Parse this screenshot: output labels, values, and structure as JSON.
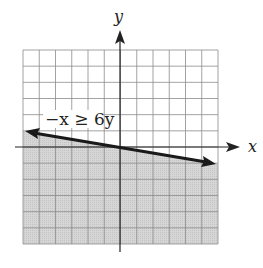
{
  "chart_data": {
    "type": "line",
    "title": "",
    "inequality_label": "−x ≥ 6y",
    "boundary_line": {
      "equation": "y = -x/6",
      "style": "solid",
      "arrows": "both"
    },
    "shaded_region": "below boundary line (y ≤ -x/6)",
    "x": [
      -6,
      6
    ],
    "values": [
      1,
      -1
    ],
    "xlabel": "x",
    "ylabel": "y",
    "xlim": [
      -5,
      7
    ],
    "ylim": [
      -6,
      6
    ],
    "grid": true,
    "grid_cells": {
      "columns": 12,
      "rows": 12
    },
    "colors": {
      "shade": "#d4d4d4",
      "grid": "#8a8a8a",
      "line": "#1a1a1a"
    }
  },
  "labels": {
    "x_axis": "x",
    "y_axis": "y",
    "inequality": "−x ≥ 6y"
  }
}
